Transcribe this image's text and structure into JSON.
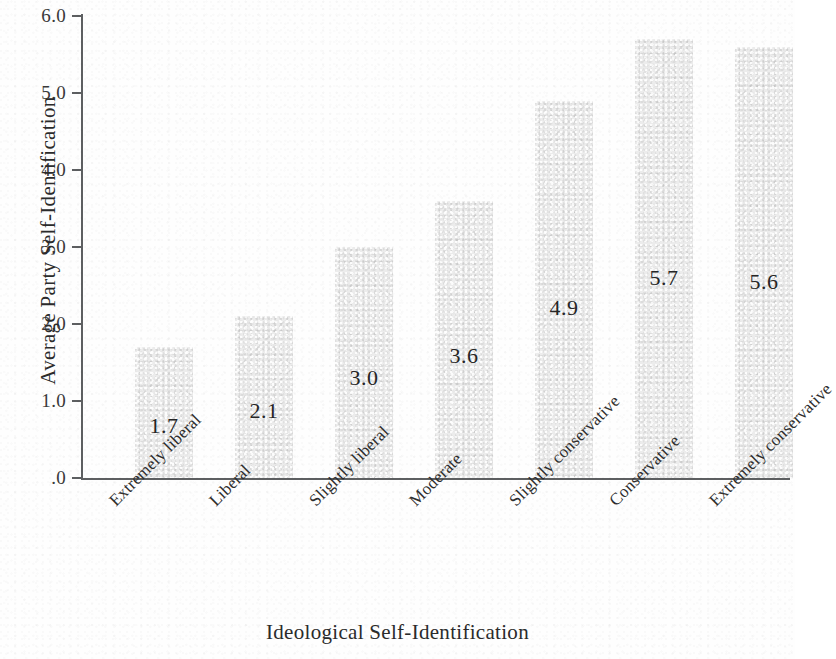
{
  "chart_data": {
    "type": "bar",
    "title": "",
    "xlabel": "Ideological Self-Identification",
    "ylabel": "Average Party Self-Identification",
    "categories": [
      "Extremely liberal",
      "Liberal",
      "Slightly liberal",
      "Moderate",
      "Slightly conservative",
      "Conservative",
      "Extremely conservative"
    ],
    "values": [
      1.7,
      2.1,
      3.0,
      3.6,
      4.9,
      5.7,
      5.6
    ],
    "value_labels": [
      "1.7",
      "2.1",
      "3.0",
      "3.6",
      "4.9",
      "5.7",
      "5.6"
    ],
    "ylim": [
      0,
      6.0
    ],
    "yticks": [
      0,
      1.0,
      2.0,
      3.0,
      4.0,
      5.0,
      6.0
    ],
    "ytick_labels": [
      ".0",
      "1.0",
      "2.0",
      "3.0",
      "4.0",
      "5.0",
      "6.0"
    ],
    "grid": false,
    "legend": null,
    "bar_color": "#ececec",
    "axis_color": "#5d5f61",
    "text_color": "#2b2b2b",
    "background_color": "#ffffff",
    "category_label_rotation_deg": -45
  },
  "axis_titles": {
    "x": "Ideological Self-Identification",
    "y": "Average Party Self-Identification"
  }
}
